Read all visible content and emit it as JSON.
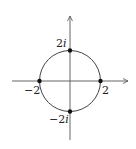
{
  "diagram": {
    "colors": {
      "stroke": "#444444",
      "axis": "#555555",
      "point": "#111111",
      "text": "#222222"
    },
    "circle": {
      "center": [
        0,
        0
      ],
      "radius": 2
    },
    "points": [
      {
        "name": "top",
        "value": "2i",
        "label_num": "2",
        "label_i": "i"
      },
      {
        "name": "bottom",
        "value": "-2i",
        "label_num": "−2",
        "label_i": "i"
      },
      {
        "name": "left",
        "value": "-2",
        "label": "−2"
      },
      {
        "name": "right",
        "value": "2",
        "label": "2"
      }
    ]
  }
}
